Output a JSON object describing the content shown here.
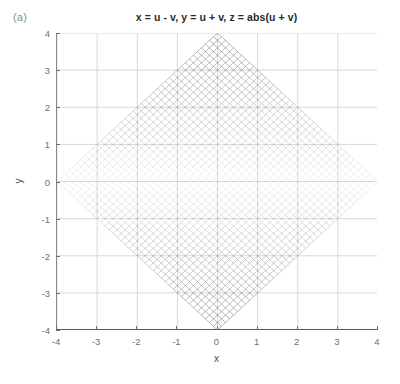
{
  "figure": {
    "panel_label": "(a)",
    "title": "x = u - v, y = u + v, z = abs(u + v)",
    "background_color": "#ffffff",
    "axis_color": "#6f6f6f",
    "grid_color": "#d8d8d8",
    "mesh_color": "#3f3f3f"
  },
  "axes": {
    "xlabel": "x",
    "ylabel": "y",
    "xticks": [
      "-4",
      "-3",
      "-2",
      "-1",
      "0",
      "1",
      "2",
      "3",
      "4"
    ],
    "yticks": [
      "4",
      "3",
      "2",
      "1",
      "0",
      "-1",
      "-2",
      "-3",
      "-4"
    ]
  },
  "chart_data": {
    "type": "line",
    "title": "x = u - v, y = u + v, z = abs(u + v)",
    "xlabel": "x",
    "ylabel": "y",
    "xlim": [
      -4,
      4
    ],
    "ylim": [
      -4,
      4
    ],
    "xticks": [
      -4,
      -3,
      -2,
      -1,
      0,
      1,
      2,
      3,
      4
    ],
    "yticks": [
      -4,
      -3,
      -2,
      -1,
      0,
      1,
      2,
      3,
      4
    ],
    "grid": true,
    "legend": "none",
    "plot_kind": "mesh-wireframe-2d-projection",
    "transform": {
      "x": "u - v",
      "y": "u + v",
      "z": "abs(u + v)"
    },
    "domain": {
      "u_min": -2,
      "u_max": 2,
      "v_min": -2,
      "v_max": 2,
      "u_steps": 40,
      "v_steps": 40
    },
    "outline_vertices": [
      [
        -4,
        0
      ],
      [
        0,
        4
      ],
      [
        4,
        0
      ],
      [
        0,
        -4
      ]
    ],
    "shading": {
      "encodes": "z = abs(u + v) = abs(y)",
      "z_min": 0,
      "z_max": 4,
      "darkest_at_y": [
        -4,
        4
      ],
      "lightest_at_y": 0,
      "colormap": "grayscale-edges"
    },
    "grid_lines_u_constant": 41,
    "grid_lines_v_constant": 41,
    "line_angle_degrees": [
      45,
      -45
    ]
  }
}
